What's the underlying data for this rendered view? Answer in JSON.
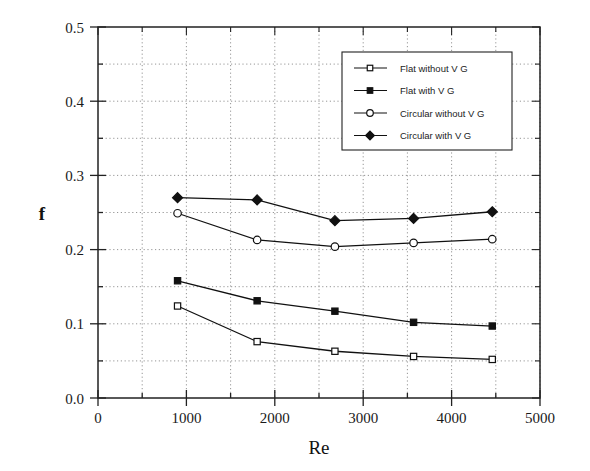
{
  "chart_data": {
    "type": "line",
    "title": "",
    "xlabel": "Re",
    "ylabel": "f",
    "xlim": [
      0,
      5000
    ],
    "ylim": [
      0.0,
      0.5
    ],
    "xticks": [
      0,
      1000,
      2000,
      3000,
      4000,
      5000
    ],
    "xtick_labels": [
      "0",
      "1000",
      "2000",
      "3000",
      "4000",
      "5000"
    ],
    "yticks": [
      0.0,
      0.1,
      0.2,
      0.3,
      0.4,
      0.5
    ],
    "ytick_labels": [
      "0.0",
      "0.1",
      "0.2",
      "0.3",
      "0.4",
      "0.5"
    ],
    "x_minor_step": 500,
    "y_minor_step": 0.05,
    "grid": true,
    "grid_style": "dotted",
    "legend_position": "upper-right",
    "x": [
      900,
      1800,
      2680,
      3570,
      4460
    ],
    "series": [
      {
        "name": "Flat without V G",
        "marker": "open-square",
        "values": [
          0.124,
          0.076,
          0.063,
          0.056,
          0.052
        ]
      },
      {
        "name": "Flat with V G",
        "marker": "filled-square",
        "values": [
          0.158,
          0.131,
          0.117,
          0.102,
          0.097
        ]
      },
      {
        "name": "Circular without V G",
        "marker": "open-circle",
        "values": [
          0.249,
          0.213,
          0.204,
          0.209,
          0.214
        ]
      },
      {
        "name": "Circular with V G",
        "marker": "filled-diamond",
        "values": [
          0.27,
          0.267,
          0.239,
          0.242,
          0.251
        ]
      }
    ]
  },
  "axes": {
    "y_title": "f",
    "x_title": "Re"
  },
  "legend": {
    "entries": [
      {
        "label": "Flat without V G"
      },
      {
        "label": "Flat with V G"
      },
      {
        "label": "Circular without V G"
      },
      {
        "label": "Circular with V G"
      }
    ]
  },
  "colors": {
    "line": "#111111",
    "grid": "#8a8a8a",
    "axis": "#222222",
    "background": "#ffffff"
  }
}
